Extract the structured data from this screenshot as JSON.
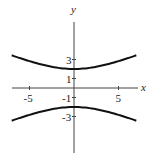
{
  "chart_data": {
    "type": "line",
    "title": "",
    "equation": "y^2/4 - x^2/25 = 1",
    "xlabel": "x",
    "ylabel": "y",
    "xlim": [
      -7,
      7
    ],
    "ylim": [
      -7,
      7
    ],
    "x_ticks": [
      {
        "value": -5,
        "label": "-5"
      },
      {
        "value": 5,
        "label": "5"
      }
    ],
    "y_ticks": [
      {
        "value": 3,
        "label": "3"
      },
      {
        "value": 1,
        "label": "1"
      },
      {
        "value": -1,
        "label": "-1"
      },
      {
        "value": -3,
        "label": "-3"
      }
    ],
    "grid": false,
    "series": [
      {
        "name": "upper branch",
        "x": [
          -7,
          -5,
          -3,
          -1,
          0,
          1,
          3,
          5,
          7
        ],
        "y": [
          3.44,
          2.83,
          2.33,
          2.04,
          2.0,
          2.04,
          2.33,
          2.83,
          3.44
        ]
      },
      {
        "name": "lower branch",
        "x": [
          -7,
          -5,
          -3,
          -1,
          0,
          1,
          3,
          5,
          7
        ],
        "y": [
          -3.44,
          -2.83,
          -2.33,
          -2.04,
          -2.0,
          -2.04,
          -2.33,
          -2.83,
          -3.44
        ]
      }
    ]
  }
}
